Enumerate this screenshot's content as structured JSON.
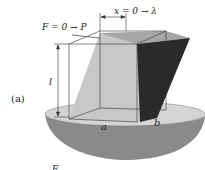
{
  "figure": {
    "panel_label": "(a)",
    "force_label": "F = 0 → P",
    "displacement_label": "x = 0 → λ",
    "height_label": "l",
    "width_label": "a",
    "depth_label": "b",
    "bottom_cut_label": "F"
  },
  "colors": {
    "base_top": "#d4d4d4",
    "base_side": "#8a8a8a",
    "solid_front": "#c8c8c8",
    "solid_top": "#a6a6a6",
    "solid_right": "#2a2a2a",
    "outline": "#333333"
  }
}
